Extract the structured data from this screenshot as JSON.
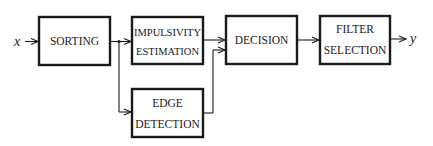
{
  "diagram": {
    "type": "block-diagram",
    "input_label": "x",
    "output_label": "y",
    "blocks": [
      {
        "id": "sorting",
        "lines": [
          "SORTING"
        ]
      },
      {
        "id": "impulsivity",
        "lines": [
          "IMPULSIVITY",
          "ESTIMATION"
        ]
      },
      {
        "id": "edge",
        "lines": [
          "EDGE",
          "DETECTION"
        ]
      },
      {
        "id": "decision",
        "lines": [
          "DECISION"
        ]
      },
      {
        "id": "filter",
        "lines": [
          "FILTER",
          "SELECTION"
        ]
      }
    ],
    "edges": [
      {
        "from": "x",
        "to": "sorting"
      },
      {
        "from": "sorting",
        "to": "impulsivity"
      },
      {
        "from": "sorting",
        "to": "edge"
      },
      {
        "from": "impulsivity",
        "to": "decision"
      },
      {
        "from": "edge",
        "to": "decision"
      },
      {
        "from": "decision",
        "to": "filter"
      },
      {
        "from": "filter",
        "to": "y"
      }
    ],
    "colors": {
      "stroke": "#1a1a1a",
      "background": "#ffffff"
    }
  }
}
